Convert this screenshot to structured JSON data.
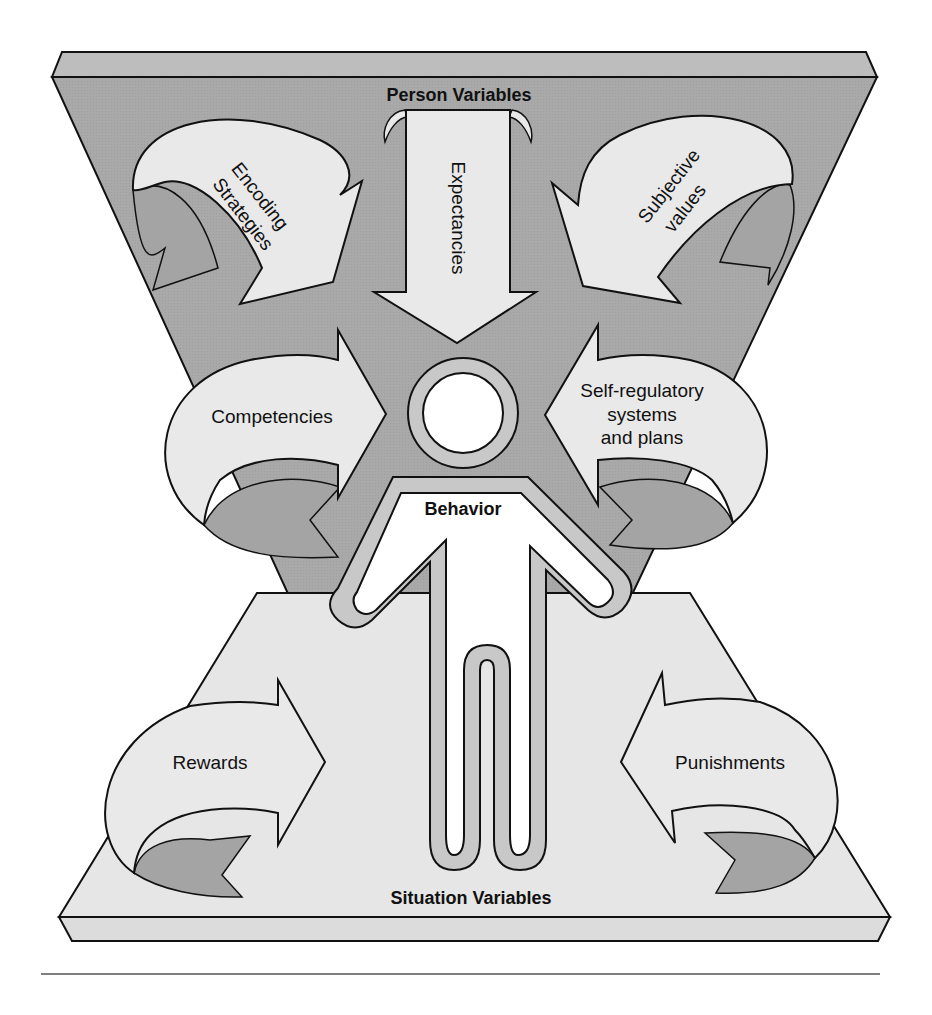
{
  "diagram": {
    "type": "conceptual-model",
    "colors": {
      "person_plate": "#a9a9a9",
      "person_plate_top": "#bdbdbd",
      "situation_plate": "#e6e6e6",
      "situation_plate_edge": "#dcdcdc",
      "arrow_fill": "#e9e9e9",
      "arrow_shadow": "#a4a4a4",
      "figure_fill": "#ffffff",
      "figure_outline_band": "#c8c8c8",
      "stroke": "#111111",
      "rule": "#555555"
    },
    "person_variables": {
      "title": "Person Variables",
      "arrows": [
        {
          "id": "encoding-strategies",
          "line1": "Encoding",
          "line2": "Strategies",
          "direction": "toward-center"
        },
        {
          "id": "expectancies",
          "label": "Expectancies",
          "direction": "down"
        },
        {
          "id": "subjective-values",
          "line1": "Subjective",
          "line2": "values",
          "direction": "toward-center"
        },
        {
          "id": "competencies",
          "label": "Competencies",
          "direction": "right"
        },
        {
          "id": "self-regulatory",
          "line1": "Self-regulatory",
          "line2": "systems",
          "line3": "and plans",
          "direction": "left"
        }
      ]
    },
    "center": {
      "label": "Behavior"
    },
    "situation_variables": {
      "title": "Situation Variables",
      "arrows": [
        {
          "id": "rewards",
          "label": "Rewards",
          "direction": "right"
        },
        {
          "id": "punishments",
          "label": "Punishments",
          "direction": "left"
        }
      ]
    }
  }
}
